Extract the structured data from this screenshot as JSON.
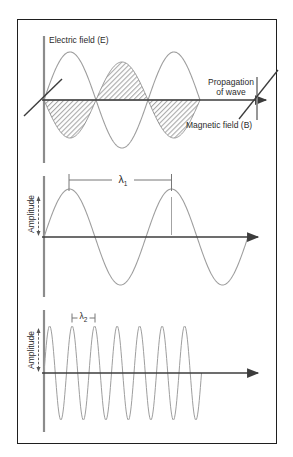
{
  "figure": {
    "panel_em": {
      "electric_label": "Electric field (E)",
      "propagation_label_line1": "Propagation",
      "propagation_label_line2": "of wave",
      "magnetic_label": "Magnetic field (B)"
    },
    "panel_wave1": {
      "ylabel": "Amplitude",
      "lambda": "λ",
      "lambda_sub": "1"
    },
    "panel_wave2": {
      "ylabel": "Amplitude",
      "lambda": "λ",
      "lambda_sub": "2"
    },
    "colors": {
      "background": "#ffffff",
      "frame_border": "#1f1f1f",
      "vertical_axis": "#8c8c8c",
      "horizontal_axis": "#3c3c3c",
      "wave_curve": "#9e9e9e",
      "hatch": "#8a8a8a",
      "text": "#2b2b2b"
    }
  },
  "waves": {
    "em_electric": {
      "x0": 44,
      "axis_y": 100,
      "amplitude": 48,
      "wavelength": 104,
      "cycles": 1.5,
      "sign": 1
    },
    "em_magnetic": {
      "x0": 44,
      "axis_y": 100,
      "amplitude": 38,
      "wavelength": 104,
      "cycles": 1.5,
      "sign": -1
    },
    "long_wave": {
      "x0": 44,
      "axis_y": 237,
      "amplitude": 48,
      "wavelength": 102,
      "cycles": 2.0,
      "sign": 1
    },
    "short_wave": {
      "x0": 44,
      "axis_y": 373,
      "amplitude": 47,
      "wavelength": 22.5,
      "cycles": 7.0,
      "sign": 1
    }
  }
}
